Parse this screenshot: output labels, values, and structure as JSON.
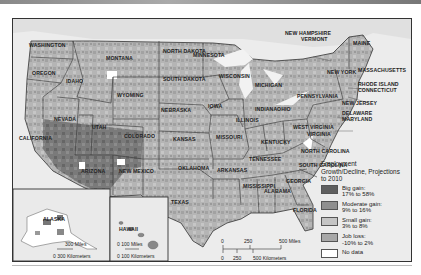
{
  "map": {
    "title": "Employment Growth/Decline, Projections to 2010",
    "states": [
      {
        "name": "WASHINGTON",
        "x": 28,
        "y": 42
      },
      {
        "name": "OREGON",
        "x": 31,
        "y": 70
      },
      {
        "name": "IDAHO",
        "x": 65,
        "y": 78
      },
      {
        "name": "MONTANA",
        "x": 105,
        "y": 55
      },
      {
        "name": "WYOMING",
        "x": 116,
        "y": 92
      },
      {
        "name": "NEVADA",
        "x": 53,
        "y": 116
      },
      {
        "name": "UTAH",
        "x": 91,
        "y": 124
      },
      {
        "name": "COLORADO",
        "x": 123,
        "y": 133
      },
      {
        "name": "CALIFORNIA",
        "x": 18,
        "y": 135
      },
      {
        "name": "ARIZONA",
        "x": 80,
        "y": 168
      },
      {
        "name": "NEW MEXICO",
        "x": 118,
        "y": 168
      },
      {
        "name": "NORTH DAKOTA",
        "x": 162,
        "y": 48
      },
      {
        "name": "SOUTH DAKOTA",
        "x": 162,
        "y": 76
      },
      {
        "name": "NEBRASKA",
        "x": 160,
        "y": 107
      },
      {
        "name": "KANSAS",
        "x": 172,
        "y": 136
      },
      {
        "name": "OKLAHOMA",
        "x": 177,
        "y": 165
      },
      {
        "name": "TEXAS",
        "x": 170,
        "y": 199
      },
      {
        "name": "MINNESOTA",
        "x": 192,
        "y": 52
      },
      {
        "name": "IOWA",
        "x": 207,
        "y": 103
      },
      {
        "name": "MISSOURI",
        "x": 215,
        "y": 134
      },
      {
        "name": "ARKANSAS",
        "x": 216,
        "y": 167
      },
      {
        "name": "WISCONSIN",
        "x": 218,
        "y": 73
      },
      {
        "name": "ILLINOIS",
        "x": 235,
        "y": 117
      },
      {
        "name": "MICHIGAN",
        "x": 254,
        "y": 82
      },
      {
        "name": "INDIANA",
        "x": 254,
        "y": 106
      },
      {
        "name": "OHIO",
        "x": 276,
        "y": 106
      },
      {
        "name": "KENTUCKY",
        "x": 260,
        "y": 139
      },
      {
        "name": "TENNESSEE",
        "x": 248,
        "y": 156
      },
      {
        "name": "MISSISSIPPI",
        "x": 242,
        "y": 183
      },
      {
        "name": "ALABAMA",
        "x": 263,
        "y": 188
      },
      {
        "name": "GEORGIA",
        "x": 285,
        "y": 178
      },
      {
        "name": "FLORIDA",
        "x": 292,
        "y": 207
      },
      {
        "name": "NORTH CAROLINA",
        "x": 300,
        "y": 148
      },
      {
        "name": "SOUTH CAROLINA",
        "x": 298,
        "y": 162
      },
      {
        "name": "WEST VIRGINIA",
        "x": 292,
        "y": 124
      },
      {
        "name": "VIRGINIA",
        "x": 306,
        "y": 131
      },
      {
        "name": "PENNSYLVANIA",
        "x": 296,
        "y": 93
      },
      {
        "name": "NEW YORK",
        "x": 326,
        "y": 69
      },
      {
        "name": "MAINE",
        "x": 352,
        "y": 40
      }
    ],
    "callouts": [
      {
        "name": "NEW HAMPSHIRE",
        "x": 284,
        "y": 30
      },
      {
        "name": "VERMONT",
        "x": 300,
        "y": 36
      },
      {
        "name": "MASSACHUSETTS",
        "x": 357,
        "y": 67
      },
      {
        "name": "RHODE ISLAND",
        "x": 357,
        "y": 81
      },
      {
        "name": "CONNECTICUT",
        "x": 357,
        "y": 87
      },
      {
        "name": "NEW JERSEY",
        "x": 341,
        "y": 100
      },
      {
        "name": "DELAWARE",
        "x": 341,
        "y": 110
      },
      {
        "name": "MARYLAND",
        "x": 341,
        "y": 116
      }
    ],
    "insets": {
      "alaska": {
        "label": "ALASKA",
        "scale_miles": "300 Miles",
        "scale_km": "0 300 Kilometers"
      },
      "hawaii": {
        "label": "HAWAII",
        "scale_miles": "0   100 Miles",
        "scale_km": "0   100 Kilometers"
      }
    },
    "scale_bar": {
      "miles_ticks": [
        "0",
        "250",
        "500 Miles"
      ],
      "km_ticks": [
        "0",
        "250",
        "500 Kilometers"
      ]
    }
  },
  "legend": {
    "title": "Employment Growth/Decline, Projections to 2010",
    "items": [
      {
        "label": "Big gain:",
        "range": "17% to 58%",
        "color": "#5f5f5f"
      },
      {
        "label": "Moderate gain:",
        "range": "9% to 16%",
        "color": "#8f8f8f"
      },
      {
        "label": "Small gain:",
        "range": "3% to 8%",
        "color": "#c4c4c4"
      },
      {
        "label": "Job loss:",
        "range": "-10% to 2%",
        "color": "#a8a8a8"
      },
      {
        "label": "No data",
        "range": "",
        "color": "#ffffff"
      }
    ]
  }
}
